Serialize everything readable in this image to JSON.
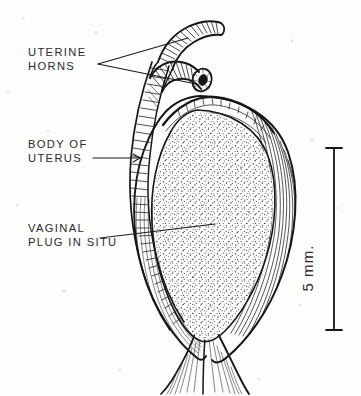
{
  "figure": {
    "background_color": "#fdfdfc",
    "ink_color": "#161616",
    "text_color": "#2b2b2b"
  },
  "labels": [
    {
      "id": "uterine-horns",
      "line1": "UTERINE",
      "line2": "HORNS",
      "x": 28,
      "y": 56,
      "y2": 70
    },
    {
      "id": "body-of-uterus",
      "line1": "BODY OF",
      "line2": "UTERUS",
      "x": 28,
      "y": 148,
      "y2": 162
    },
    {
      "id": "vaginal-plug",
      "line1": "VAGINAL",
      "line2": "PLUG IN SITU",
      "x": 28,
      "y": 232,
      "y2": 246
    }
  ],
  "scale_bar": {
    "label": "5 mm.",
    "value": 5,
    "unit": "mm.",
    "orientation": "vertical",
    "top_y": 148,
    "bottom_y": 330,
    "x": 334,
    "text_x": 313,
    "text_y": 268
  },
  "structures": [
    {
      "name": "uterine-horn-upper",
      "description": "tubular horn with transverse hatching, directed upper right"
    },
    {
      "name": "uterine-horn-lower-cut",
      "description": "cut tubular horn showing open lumen"
    },
    {
      "name": "body-of-uterus-wall",
      "description": "curved left band with dense transverse hatching"
    },
    {
      "name": "uterus-outer-wall",
      "description": "right wall with long flowing longitudinal strokes"
    },
    {
      "name": "vaginal-plug",
      "description": "stippled ovoid mass filling the uterine lumen"
    },
    {
      "name": "cervix-vagina",
      "description": "narrow striated neck at base"
    }
  ]
}
